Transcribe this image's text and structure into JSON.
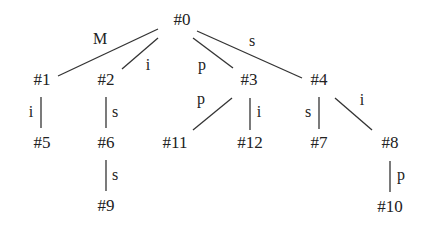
{
  "diagram": {
    "type": "tree",
    "nodes": [
      {
        "id": "n0",
        "label": "#0",
        "x": 182,
        "y": 25
      },
      {
        "id": "n1",
        "label": "#1",
        "x": 42,
        "y": 85
      },
      {
        "id": "n2",
        "label": "#2",
        "x": 106,
        "y": 85
      },
      {
        "id": "n3",
        "label": "#3",
        "x": 249,
        "y": 85
      },
      {
        "id": "n4",
        "label": "#4",
        "x": 319,
        "y": 85
      },
      {
        "id": "n5",
        "label": "#5",
        "x": 42,
        "y": 148
      },
      {
        "id": "n6",
        "label": "#6",
        "x": 106,
        "y": 148
      },
      {
        "id": "n7",
        "label": "#7",
        "x": 319,
        "y": 148
      },
      {
        "id": "n8",
        "label": "#8",
        "x": 390,
        "y": 148
      },
      {
        "id": "n9",
        "label": "#9",
        "x": 106,
        "y": 211
      },
      {
        "id": "n10",
        "label": "#10",
        "x": 390,
        "y": 212
      },
      {
        "id": "n11",
        "label": "#11",
        "x": 175,
        "y": 148
      },
      {
        "id": "n12",
        "label": "#12",
        "x": 250,
        "y": 148
      }
    ],
    "edges": [
      {
        "from": "n0",
        "to": "n1",
        "label": "M",
        "x1": 158,
        "y1": 29,
        "x2": 58,
        "y2": 76,
        "lx": 100,
        "ly": 44
      },
      {
        "from": "n0",
        "to": "n2",
        "label": "i",
        "x1": 158,
        "y1": 38,
        "x2": 122,
        "y2": 69,
        "lx": 148,
        "ly": 70
      },
      {
        "from": "n0",
        "to": "n3",
        "label": "p",
        "x1": 193,
        "y1": 38,
        "x2": 233,
        "y2": 68,
        "lx": 202,
        "ly": 70
      },
      {
        "from": "n0",
        "to": "n4",
        "label": "s",
        "x1": 197,
        "y1": 31,
        "x2": 302,
        "y2": 78,
        "lx": 252,
        "ly": 46
      },
      {
        "from": "n1",
        "to": "n5",
        "label": "i",
        "x1": 41,
        "y1": 97,
        "x2": 41,
        "y2": 128,
        "lx": 31,
        "ly": 117
      },
      {
        "from": "n2",
        "to": "n6",
        "label": "s",
        "x1": 106,
        "y1": 97,
        "x2": 106,
        "y2": 128,
        "lx": 115,
        "ly": 117
      },
      {
        "from": "n6",
        "to": "n9",
        "label": "s",
        "x1": 106,
        "y1": 160,
        "x2": 106,
        "y2": 191,
        "lx": 115,
        "ly": 180
      },
      {
        "from": "n3",
        "to": "n11",
        "label": "p",
        "x1": 232,
        "y1": 98,
        "x2": 193,
        "y2": 130,
        "lx": 201,
        "ly": 104
      },
      {
        "from": "n3",
        "to": "n12",
        "label": "i",
        "x1": 250,
        "y1": 98,
        "x2": 250,
        "y2": 130,
        "lx": 259,
        "ly": 117
      },
      {
        "from": "n4",
        "to": "n7",
        "label": "s",
        "x1": 319,
        "y1": 97,
        "x2": 319,
        "y2": 129,
        "lx": 308,
        "ly": 117
      },
      {
        "from": "n4",
        "to": "n8",
        "label": "i",
        "x1": 335,
        "y1": 98,
        "x2": 372,
        "y2": 130,
        "lx": 362,
        "ly": 105
      },
      {
        "from": "n8",
        "to": "n10",
        "label": "p",
        "x1": 390,
        "y1": 161,
        "x2": 390,
        "y2": 192,
        "lx": 401,
        "ly": 180
      }
    ]
  }
}
